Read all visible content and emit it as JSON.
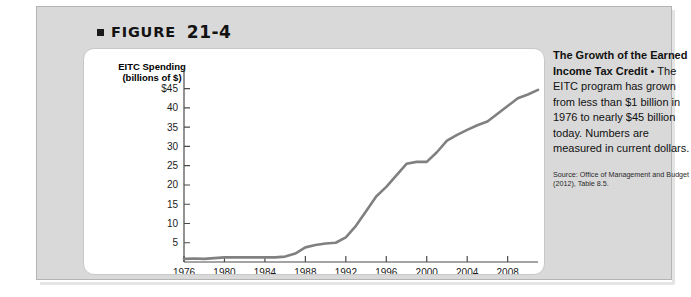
{
  "figure": {
    "bullet_icon": "square-bullet-icon",
    "label": "FIGURE",
    "number": "21-4"
  },
  "chart_card": {
    "y_axis_title": "EITC Spending (billions of $)"
  },
  "caption": {
    "lead": "The Growth of the Earned Income Tax Credit",
    "separator": " • ",
    "body": "The EITC program has grown from less than $1 billion in 1976 to nearly $45 billion today. Numbers are measured in current dollars.",
    "source": "Source: Office of Management and Budget (2012), Table 8.5."
  },
  "chart_data": {
    "type": "line",
    "title": "EITC Spending (billions of $)",
    "xlabel": "",
    "ylabel": "EITC Spending (billions of $)",
    "xlim": [
      1976,
      2011
    ],
    "ylim": [
      0,
      47
    ],
    "xticks": [
      1976,
      1980,
      1984,
      1988,
      1992,
      1996,
      2000,
      2004,
      2008
    ],
    "xtick_labels": [
      "1976",
      "1980",
      "1984",
      "1988",
      "1992",
      "1996",
      "2000",
      "2004",
      "2008"
    ],
    "yticks": [
      5,
      10,
      15,
      20,
      25,
      30,
      35,
      40,
      45
    ],
    "ytick_labels": [
      "5",
      "10",
      "15",
      "20",
      "25",
      "30",
      "35",
      "40",
      "$45"
    ],
    "grid": false,
    "legend": null,
    "line_color": "#808080",
    "line_width": 2.6,
    "series": [
      {
        "name": "EITC Spending",
        "x": [
          1976,
          1977,
          1978,
          1979,
          1980,
          1981,
          1982,
          1983,
          1984,
          1985,
          1986,
          1987,
          1988,
          1989,
          1990,
          1991,
          1992,
          1993,
          1994,
          1995,
          1996,
          1997,
          1998,
          1999,
          2000,
          2001,
          2002,
          2003,
          2004,
          2005,
          2006,
          2007,
          2008,
          2009,
          2010,
          2011
        ],
        "values": [
          0.8,
          0.9,
          0.8,
          1.0,
          1.2,
          1.2,
          1.2,
          1.2,
          1.2,
          1.2,
          1.4,
          2.2,
          3.8,
          4.4,
          4.8,
          5.0,
          6.4,
          9.4,
          13.2,
          17.0,
          19.5,
          22.5,
          25.5,
          26.0,
          26.0,
          28.5,
          31.5,
          33.0,
          34.3,
          35.5,
          36.5,
          38.5,
          40.5,
          42.5,
          43.5,
          44.7
        ]
      }
    ]
  }
}
